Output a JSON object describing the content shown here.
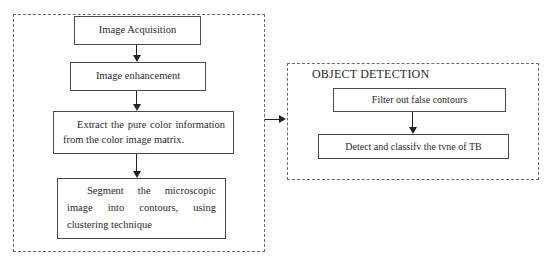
{
  "preprocessing": {
    "steps": [
      {
        "label": "Image Acquisition"
      },
      {
        "label": "Image enhancement"
      },
      {
        "label": "Extract the pure color information from the color image matrix."
      },
      {
        "label": "Segment the microscopic image into contours, using clustering technique"
      }
    ]
  },
  "object_detection": {
    "title": "OBJECT DETECTION",
    "steps": [
      {
        "label": "Filter out false contours"
      },
      {
        "label": "Detect and classifv the tvne of TB"
      }
    ]
  }
}
